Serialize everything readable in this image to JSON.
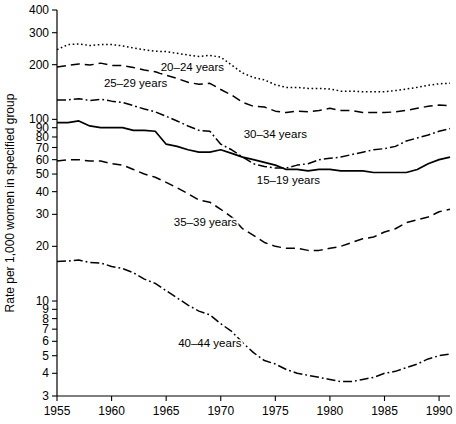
{
  "chart_data": {
    "type": "line",
    "title": "",
    "xlabel": "",
    "ylabel": "Rate per 1,000 women in specified group",
    "yscale": "log",
    "ylim": [
      3,
      400
    ],
    "xlim": [
      1955,
      1991
    ],
    "grid": false,
    "legend_position": "inline-annotations",
    "x_ticks": [
      "1955",
      "1960",
      "1965",
      "1970",
      "1975",
      "1980",
      "1985",
      "1990"
    ],
    "x_tick_values": [
      1955,
      1960,
      1965,
      1970,
      1975,
      1980,
      1985,
      1990
    ],
    "y_ticks": [
      "400",
      "300",
      "200",
      "100",
      "90",
      "80",
      "70",
      "60",
      "50",
      "40",
      "30",
      "20",
      "10",
      "9",
      "8",
      "7",
      "6",
      "5",
      "4",
      "3"
    ],
    "y_tick_values": [
      400,
      300,
      200,
      100,
      90,
      80,
      70,
      60,
      50,
      40,
      30,
      20,
      10,
      9,
      8,
      7,
      6,
      5,
      4,
      3
    ],
    "x": [
      1955,
      1956,
      1957,
      1958,
      1959,
      1960,
      1961,
      1962,
      1963,
      1964,
      1965,
      1966,
      1967,
      1968,
      1969,
      1970,
      1971,
      1972,
      1973,
      1974,
      1975,
      1976,
      1977,
      1978,
      1979,
      1980,
      1981,
      1982,
      1983,
      1984,
      1985,
      1986,
      1987,
      1988,
      1989,
      1990,
      1991
    ],
    "series": [
      {
        "name": "20-24 years",
        "label": "20–24 years",
        "dash": "dotted",
        "label_x": 1967.4,
        "label_y": 185,
        "values": [
          242,
          258,
          260,
          255,
          258,
          258,
          254,
          247,
          242,
          237,
          236,
          231,
          226,
          222,
          225,
          220,
          199,
          180,
          170,
          165,
          155,
          150,
          150,
          148,
          148,
          147,
          143,
          143,
          142,
          142,
          142,
          144,
          147,
          150,
          154,
          157,
          158
        ]
      },
      {
        "name": "25-29 years",
        "label": "25–29 years",
        "dash": "dashed",
        "label_x": 1962.2,
        "label_y": 150,
        "values": [
          194,
          198,
          202,
          199,
          204,
          198,
          198,
          193,
          187,
          183,
          175,
          168,
          160,
          156,
          158,
          146,
          136,
          124,
          118,
          117,
          111,
          109,
          111,
          110,
          112,
          115,
          112,
          112,
          109,
          109,
          109,
          110,
          112,
          115,
          118,
          120,
          119
        ]
      },
      {
        "name": "30-34 years",
        "label": "30–34 years",
        "dash": "dashdot",
        "label_x": 1975.0,
        "label_y": 79,
        "values": [
          128,
          128,
          130,
          127,
          129,
          126,
          124,
          119,
          114,
          110,
          104,
          98,
          92,
          87,
          86,
          73,
          68,
          62,
          57,
          55,
          54,
          54,
          56,
          57,
          60,
          61,
          62,
          64,
          66,
          68,
          69,
          71,
          76,
          79,
          82,
          86,
          89
        ]
      },
      {
        "name": "15-19 years",
        "label": "15–19 years",
        "dash": "solid",
        "label_x": 1976.2,
        "label_y": 44,
        "values": [
          96,
          96,
          98,
          92,
          90,
          90,
          90,
          87,
          87,
          86,
          73,
          71,
          68,
          66,
          66,
          68,
          65,
          62,
          60,
          58,
          56,
          53,
          53,
          52,
          53,
          53,
          52,
          52,
          52,
          51,
          51,
          51,
          51,
          53,
          57,
          60,
          62
        ]
      },
      {
        "name": "35-39 years",
        "label": "35–39 years",
        "dash": "dashed",
        "label_x": 1968.6,
        "label_y": 26,
        "values": [
          59,
          60,
          60,
          59,
          59,
          57,
          56,
          53,
          50,
          48,
          45,
          42,
          39,
          36,
          35,
          32,
          29,
          25,
          23,
          21,
          20,
          19.5,
          19.5,
          19,
          19,
          19.5,
          20,
          21,
          22,
          22.5,
          24,
          25,
          27,
          28,
          29,
          31,
          32
        ]
      },
      {
        "name": "40-44 years",
        "label": "40–44 years",
        "dash": "dashdot",
        "label_x": 1969.0,
        "label_y": 5.6,
        "values": [
          16.5,
          16.6,
          16.8,
          16.3,
          16.2,
          15.5,
          15.1,
          14.3,
          13.2,
          12.5,
          11.4,
          10.4,
          9.5,
          8.8,
          8.4,
          7.5,
          6.8,
          5.9,
          5.2,
          4.7,
          4.5,
          4.2,
          4.0,
          3.9,
          3.8,
          3.7,
          3.6,
          3.6,
          3.7,
          3.8,
          4.0,
          4.1,
          4.3,
          4.5,
          4.8,
          5.0,
          5.1
        ]
      }
    ]
  }
}
